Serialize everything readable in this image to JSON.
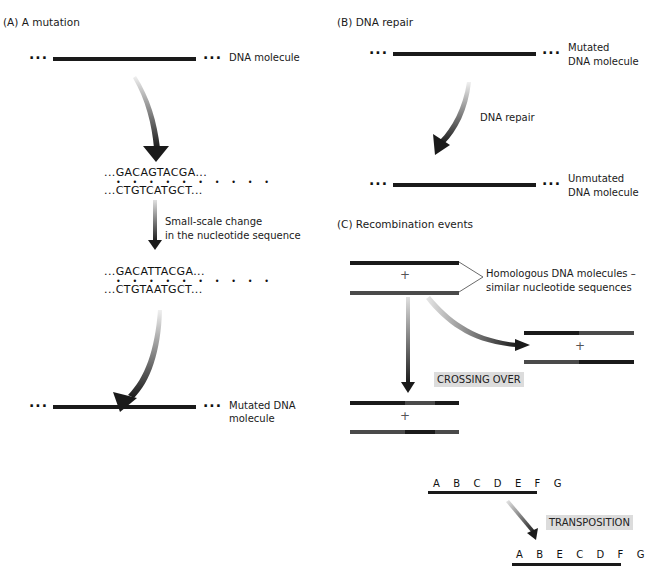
{
  "panel_a": {
    "title": "(A) A mutation",
    "top_molecule_label": "DNA molecule",
    "original_sequence": {
      "top": "...GACAGTACGA...",
      "pairing_dots": "• • • • • • • • • •",
      "bottom": "...CTGTCATGCT..."
    },
    "change_label_line1": "Small-scale change",
    "change_label_line2": "in the nucleotide sequence",
    "mutated_sequence": {
      "top": "...GACATTACGA...",
      "pairing_dots": "• • • • • • • • • •",
      "bottom": "...CTGTAATGCT..."
    },
    "bottom_molecule_label_line1": "Mutated DNA",
    "bottom_molecule_label_line2": "molecule"
  },
  "panel_b": {
    "title": "(B) DNA repair",
    "top_label_line1": "Mutated",
    "top_label_line2": "DNA molecule",
    "arrow_label": "DNA repair",
    "bottom_label_line1": "Unmutated",
    "bottom_label_line2": "DNA molecule"
  },
  "panel_c": {
    "title": "(C) Recombination events",
    "homologous_label_line1": "Homologous DNA molecules –",
    "homologous_label_line2": "similar nucleotide sequences",
    "plus_symbol": "+",
    "crossing_over_tag": "CROSSING OVER",
    "transposition_tag": "TRANSPOSITION",
    "original_gene_order": [
      "A",
      "B",
      "C",
      "D",
      "E",
      "F",
      "G"
    ],
    "transposed_gene_order": [
      "A",
      "B",
      "E",
      "C",
      "D",
      "F",
      "G"
    ],
    "original_gene_string": "A B C D E F G",
    "transposed_gene_string": "A B E C D F G"
  },
  "colors": {
    "strand_dark": "#1a1a1a",
    "strand_gray": "#4a4a4a",
    "tag_background": "#dcdcdc",
    "arrow_dark": "#1a1a1a",
    "arrow_light": "#d8d8d8"
  }
}
